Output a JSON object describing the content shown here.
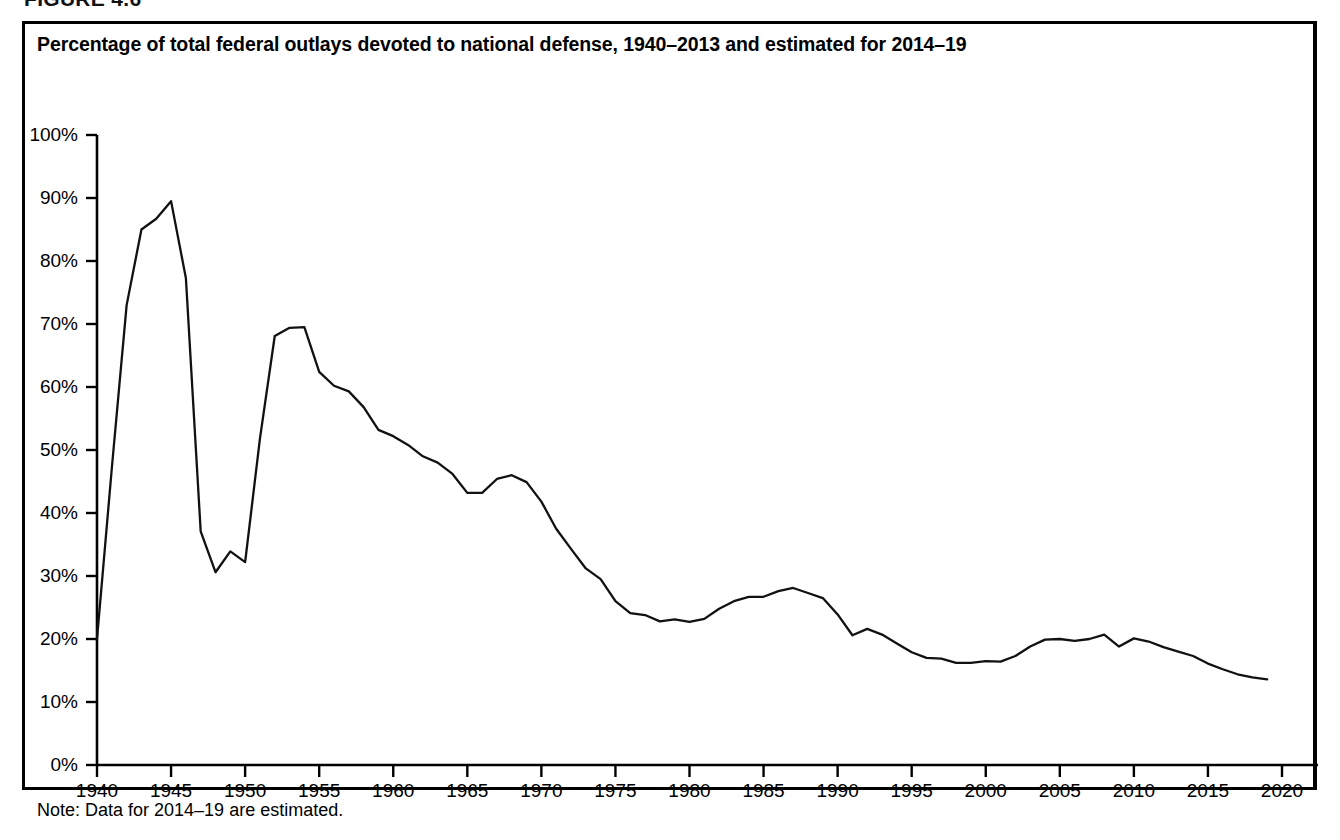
{
  "figure": {
    "label": "FIGURE 4.6",
    "title": "Percentage of total federal outlays devoted to national defense, 1940–2013 and estimated for 2014–19",
    "note": "Note: Data for 2014–19 are estimated."
  },
  "chart_data": {
    "type": "line",
    "title": "Percentage of total federal outlays devoted to national defense, 1940–2013 and estimated for 2014–19",
    "subtitle": "",
    "xlabel": "",
    "ylabel": "",
    "xlim": [
      1940,
      2020
    ],
    "ylim": [
      0,
      100
    ],
    "grid": false,
    "legend": false,
    "legend_position": "none",
    "line_color": "#111111",
    "y_tick_labels": [
      "0%",
      "10%",
      "20%",
      "30%",
      "40%",
      "50%",
      "60%",
      "70%",
      "80%",
      "90%",
      "100%"
    ],
    "y_tick_values": [
      0,
      10,
      20,
      30,
      40,
      50,
      60,
      70,
      80,
      90,
      100
    ],
    "x_tick_labels": [
      "1940",
      "1945",
      "1950",
      "1955",
      "1960",
      "1965",
      "1970",
      "1975",
      "1980",
      "1985",
      "1990",
      "1995",
      "2000",
      "2005",
      "2010",
      "2015",
      "2020"
    ],
    "x_tick_values": [
      1940,
      1945,
      1950,
      1955,
      1960,
      1965,
      1970,
      1975,
      1980,
      1985,
      1990,
      1995,
      2000,
      2005,
      2010,
      2015,
      2020
    ],
    "annotations": [
      "Note: Data for 2014–19 are estimated."
    ],
    "series": [
      {
        "name": "National defense share of total federal outlays",
        "units": "percent",
        "x": [
          1940,
          1941,
          1942,
          1943,
          1944,
          1945,
          1946,
          1947,
          1948,
          1949,
          1950,
          1951,
          1952,
          1953,
          1954,
          1955,
          1956,
          1957,
          1958,
          1959,
          1960,
          1961,
          1962,
          1963,
          1964,
          1965,
          1966,
          1967,
          1968,
          1969,
          1970,
          1971,
          1972,
          1973,
          1974,
          1975,
          1976,
          1977,
          1978,
          1979,
          1980,
          1981,
          1982,
          1983,
          1984,
          1985,
          1986,
          1987,
          1988,
          1989,
          1990,
          1991,
          1992,
          1993,
          1994,
          1995,
          1996,
          1997,
          1998,
          1999,
          2000,
          2001,
          2002,
          2003,
          2004,
          2005,
          2006,
          2007,
          2008,
          2009,
          2010,
          2011,
          2012,
          2013,
          2014,
          2015,
          2016,
          2017,
          2018,
          2019
        ],
        "values": [
          20.0,
          47.1,
          73.0,
          85.0,
          86.7,
          89.5,
          77.3,
          37.1,
          30.6,
          33.9,
          32.2,
          51.8,
          68.1,
          69.4,
          69.5,
          62.4,
          60.2,
          59.3,
          56.8,
          53.2,
          52.2,
          50.8,
          49.0,
          48.0,
          46.2,
          43.2,
          43.2,
          45.4,
          46.0,
          44.9,
          41.8,
          37.5,
          34.3,
          31.2,
          29.5,
          26.0,
          24.1,
          23.8,
          22.8,
          23.1,
          22.7,
          23.2,
          24.8,
          26.0,
          26.7,
          26.7,
          27.6,
          28.1,
          27.3,
          26.5,
          23.9,
          20.6,
          21.6,
          20.7,
          19.3,
          17.9,
          17.0,
          16.9,
          16.2,
          16.2,
          16.5,
          16.4,
          17.3,
          18.8,
          19.9,
          20.0,
          19.7,
          20.0,
          20.7,
          18.8,
          20.1,
          19.6,
          18.7,
          18.0,
          17.3,
          16.1,
          15.2,
          14.4,
          13.9,
          13.6
        ]
      }
    ]
  }
}
